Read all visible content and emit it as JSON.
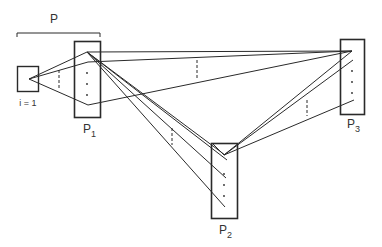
{
  "diagram": {
    "bracket_label": "P",
    "nodes": [
      {
        "id": "i1",
        "label": "i = 1",
        "sub": ""
      },
      {
        "id": "p1",
        "label": "P",
        "sub": "1"
      },
      {
        "id": "p2",
        "label": "P",
        "sub": "2"
      },
      {
        "id": "p3",
        "label": "P",
        "sub": "3"
      }
    ],
    "colors": {
      "stroke": "#2a2a2a",
      "background": "#ffffff"
    }
  }
}
